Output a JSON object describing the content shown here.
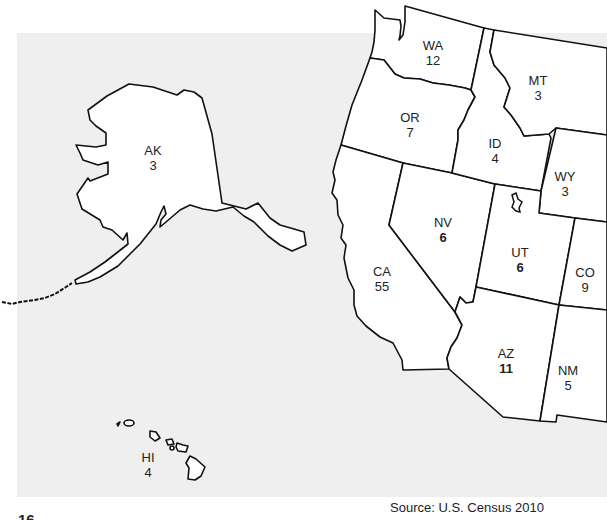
{
  "map": {
    "title": "Electoral votes by state (Western U.S.)",
    "source": "Source: U.S. Census 2010",
    "page_number": "16",
    "colors": {
      "background": "#efefef",
      "state_fill": "#ffffff",
      "border": "#111111"
    },
    "states": [
      {
        "abbr": "AK",
        "value": "3",
        "bold": false
      },
      {
        "abbr": "HI",
        "value": "4",
        "bold": false
      },
      {
        "abbr": "WA",
        "value": "12",
        "bold": false
      },
      {
        "abbr": "OR",
        "value": "7",
        "bold": false
      },
      {
        "abbr": "CA",
        "value": "55",
        "bold": false
      },
      {
        "abbr": "NV",
        "value": "6",
        "bold": true
      },
      {
        "abbr": "ID",
        "value": "4",
        "bold": false
      },
      {
        "abbr": "MT",
        "value": "3",
        "bold": false
      },
      {
        "abbr": "WY",
        "value": "3",
        "bold": false
      },
      {
        "abbr": "UT",
        "value": "6",
        "bold": true
      },
      {
        "abbr": "CO",
        "value": "9",
        "bold": false
      },
      {
        "abbr": "AZ",
        "value": "11",
        "bold": true
      },
      {
        "abbr": "NM",
        "value": "5",
        "bold": false
      }
    ]
  }
}
